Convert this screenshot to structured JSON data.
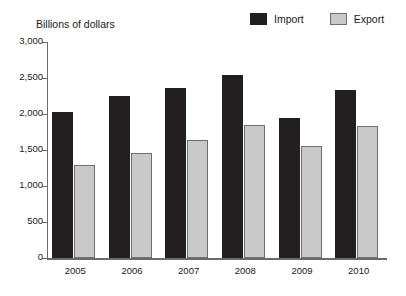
{
  "chart_data": {
    "type": "bar",
    "title": "",
    "ylabel": "Billions of dollars",
    "xlabel": "",
    "categories": [
      "2005",
      "2006",
      "2007",
      "2008",
      "2009",
      "2010"
    ],
    "series": [
      {
        "name": "Import",
        "color": "#231f20",
        "values": [
          2030,
          2250,
          2360,
          2540,
          1945,
          2335
        ]
      },
      {
        "name": "Export",
        "color": "#c9c9c9",
        "values": [
          1290,
          1460,
          1640,
          1850,
          1555,
          1835
        ]
      }
    ],
    "ylim": [
      0,
      3000
    ],
    "ytick_values": [
      0,
      500,
      1000,
      1500,
      2000,
      2500,
      3000
    ],
    "ytick_labels": [
      "0",
      "500",
      "1,000",
      "1,500",
      "2,000",
      "2,500",
      "3,000"
    ],
    "grid": false,
    "legend_position": "top-right"
  },
  "legend": {
    "import_label": "Import",
    "export_label": "Export"
  },
  "axis": {
    "unit_title": "Billions of dollars"
  }
}
